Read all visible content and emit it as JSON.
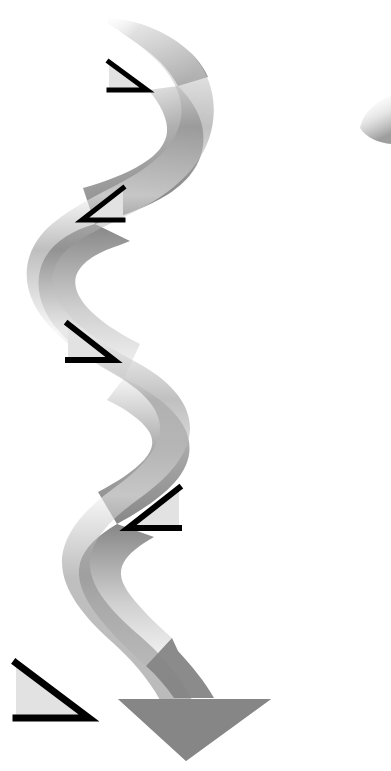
{
  "image": {
    "kind": "decorative-vector-illustration",
    "title": "Serpentine ribbon arrow with five right triangles",
    "width": 391,
    "height": 771,
    "background_color": "#ffffff",
    "text_content": "",
    "has_text": false
  },
  "palette": {
    "background": "#ffffff",
    "ribbon_dark": "#808080",
    "ribbon_mid": "#9a9a9a",
    "ribbon_light": "#ededed",
    "ribbon_highlight": "#fbfbfb",
    "triangle_fill": "#e2e2e2",
    "triangle_stroke": "#000000",
    "sliver_gray": "#bcbcbc"
  },
  "ribbon": {
    "name": "serpentine-ribbon-arrow",
    "description": "Wide S-curved ribbon band flowing from upper area downward, ending in a solid downward arrowhead",
    "flow_direction": "top-to-bottom",
    "curve_type": "serpentine-s-curve",
    "band_width_px": 40,
    "tail_start": {
      "x": 110,
      "y": 18
    },
    "arrow_tip": {
      "x": 186,
      "y": 761
    },
    "arrowhead": {
      "name": "ribbon-arrowhead",
      "left_corner": {
        "x": 118,
        "y": 700
      },
      "right_corner": {
        "x": 271,
        "y": 700
      },
      "tip": {
        "x": 186,
        "y": 761
      }
    },
    "gradient_stops": [
      {
        "offset": 0.0,
        "color": "#fdfdfd"
      },
      {
        "offset": 0.08,
        "color": "#c9c9c9"
      },
      {
        "offset": 0.16,
        "color": "#8d8d8d"
      },
      {
        "offset": 0.26,
        "color": "#f2f2f2"
      },
      {
        "offset": 0.34,
        "color": "#8a8a8a"
      },
      {
        "offset": 0.46,
        "color": "#f4f4f4"
      },
      {
        "offset": 0.56,
        "color": "#8c8c8c"
      },
      {
        "offset": 0.7,
        "color": "#efefef"
      },
      {
        "offset": 0.82,
        "color": "#8b8b8b"
      },
      {
        "offset": 1.0,
        "color": "#838383"
      }
    ]
  },
  "sliver": {
    "name": "edge-ribbon-sliver",
    "description": "Faint partial curved ribbon fragment clipped by the right edge of the canvas",
    "bbox": {
      "x": 357,
      "y": 98,
      "width": 34,
      "height": 46
    },
    "color": "#c2c2c2"
  },
  "triangles": [
    {
      "id": 1,
      "name": "triangle-1",
      "orientation": "right-angle-bottom-right",
      "mirrored": false,
      "bbox": {
        "x": 107,
        "y": 60,
        "width": 42,
        "height": 33
      },
      "fill": "#e2e2e2",
      "stroke": "#000000",
      "stroke_width": 5
    },
    {
      "id": 2,
      "name": "triangle-2",
      "orientation": "right-angle-bottom-left",
      "mirrored": true,
      "bbox": {
        "x": 80,
        "y": 186,
        "width": 46,
        "height": 37
      },
      "fill": "#e2e2e2",
      "stroke": "#000000",
      "stroke_width": 5
    },
    {
      "id": 3,
      "name": "triangle-3",
      "orientation": "right-angle-bottom-right",
      "mirrored": false,
      "bbox": {
        "x": 65,
        "y": 321,
        "width": 52,
        "height": 42
      },
      "fill": "#e2e2e2",
      "stroke": "#000000",
      "stroke_width": 6
    },
    {
      "id": 4,
      "name": "triangle-4",
      "orientation": "right-angle-bottom-left",
      "mirrored": true,
      "bbox": {
        "x": 125,
        "y": 485,
        "width": 57,
        "height": 46
      },
      "fill": "#e2e2e2",
      "stroke": "#000000",
      "stroke_width": 6
    },
    {
      "id": 5,
      "name": "triangle-5",
      "orientation": "right-angle-bottom-right",
      "mirrored": false,
      "bbox": {
        "x": 12,
        "y": 660,
        "width": 80,
        "height": 62
      },
      "fill": "#e2e2e2",
      "stroke": "#000000",
      "stroke_width": 7
    }
  ]
}
